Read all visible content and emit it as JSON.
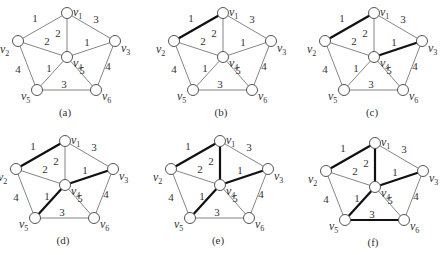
{
  "graph": {
    "nodes": [
      {
        "id": "v1",
        "label": "v",
        "sub": "1",
        "x": 67,
        "y": 13,
        "lx": 6,
        "ly": 3
      },
      {
        "id": "v2",
        "label": "v",
        "sub": "2",
        "x": 18,
        "y": 41,
        "lx": -18,
        "ly": 12
      },
      {
        "id": "v3",
        "label": "v",
        "sub": "3",
        "x": 115,
        "y": 41,
        "lx": 6,
        "ly": 11
      },
      {
        "id": "v4",
        "label": "v",
        "sub": "4",
        "x": 67,
        "y": 57,
        "lx": 6,
        "ly": 10
      },
      {
        "id": "v5",
        "label": "v",
        "sub": "5",
        "x": 37,
        "y": 90,
        "lx": -16,
        "ly": 10
      },
      {
        "id": "v6",
        "label": "v",
        "sub": "6",
        "x": 96,
        "y": 90,
        "lx": 6,
        "ly": 10
      }
    ],
    "edges": [
      {
        "id": "v1-v2",
        "from": "v1",
        "to": "v2",
        "weight": "1",
        "wx": 35,
        "wy": 22
      },
      {
        "id": "v1-v3",
        "from": "v1",
        "to": "v3",
        "weight": "3",
        "wx": 96,
        "wy": 23
      },
      {
        "id": "v1-v4",
        "from": "v1",
        "to": "v4",
        "weight": "2",
        "wx": 58,
        "wy": 37
      },
      {
        "id": "v2-v4",
        "from": "v2",
        "to": "v4",
        "weight": "2",
        "wx": 47,
        "wy": 45
      },
      {
        "id": "v3-v4",
        "from": "v3",
        "to": "v4",
        "weight": "1",
        "wx": 87,
        "wy": 46
      },
      {
        "id": "v2-v5",
        "from": "v2",
        "to": "v5",
        "weight": "4",
        "wx": 18,
        "wy": 73
      },
      {
        "id": "v4-v5",
        "from": "v4",
        "to": "v5",
        "weight": "1",
        "wx": 49,
        "wy": 72
      },
      {
        "id": "v4-v6",
        "from": "v4",
        "to": "v6",
        "weight": "5",
        "wx": 82,
        "wy": 74
      },
      {
        "id": "v3-v6",
        "from": "v3",
        "to": "v6",
        "weight": "4",
        "wx": 108,
        "wy": 70
      },
      {
        "id": "v5-v6",
        "from": "v5",
        "to": "v6",
        "weight": "3",
        "wx": 64,
        "wy": 88
      }
    ]
  },
  "panels": [
    {
      "id": "a",
      "caption": "(a)",
      "ox": 0,
      "oy": 0,
      "bold_edges": []
    },
    {
      "id": "b",
      "caption": "(b)",
      "ox": 156,
      "oy": 0,
      "bold_edges": [
        "v1-v2"
      ]
    },
    {
      "id": "c",
      "caption": "(c)",
      "ox": 307,
      "oy": 0,
      "bold_edges": [
        "v1-v2",
        "v3-v4"
      ]
    },
    {
      "id": "d",
      "caption": "(d)",
      "ox": -2,
      "oy": 128,
      "bold_edges": [
        "v1-v2",
        "v3-v4",
        "v4-v5"
      ]
    },
    {
      "id": "e",
      "caption": "(e)",
      "ox": 153,
      "oy": 128,
      "bold_edges": [
        "v1-v2",
        "v3-v4",
        "v4-v5",
        "v1-v4"
      ]
    },
    {
      "id": "f",
      "caption": "(f)",
      "ox": 308,
      "oy": 130,
      "bold_edges": [
        "v1-v2",
        "v3-v4",
        "v4-v5",
        "v1-v4",
        "v5-v6"
      ]
    }
  ],
  "caption_pos": {
    "x": 65,
    "y": 116
  },
  "node_radius": 5.5
}
